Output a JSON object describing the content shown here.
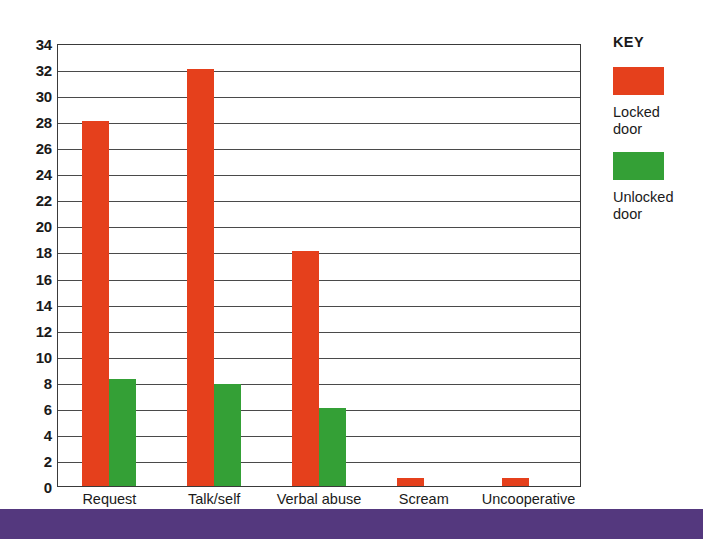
{
  "chart_data": {
    "type": "bar",
    "title": "",
    "subtitle": "",
    "xlabel": "",
    "ylabel": "",
    "categories": [
      "Request",
      "Talk/self",
      "Verbal abuse",
      "Scream",
      "Uncooperative"
    ],
    "series": [
      {
        "name": "Locked door",
        "color": "#e5401c",
        "values": [
          28,
          32,
          18,
          0.6,
          0.6
        ]
      },
      {
        "name": "Unlocked door",
        "color": "#34a036",
        "values": [
          8.2,
          7.8,
          6,
          0,
          0
        ]
      }
    ],
    "ylim": [
      0,
      34
    ],
    "ytick_step": 2,
    "yticks": [
      "34",
      "32",
      "30",
      "28",
      "26",
      "24",
      "22",
      "20",
      "18",
      "16",
      "14",
      "12",
      "10",
      "8",
      "6",
      "4",
      "2",
      "0"
    ],
    "grid": true,
    "grid_axis": "y",
    "legend_position": "right"
  },
  "legend": {
    "title": "KEY",
    "entries": [
      {
        "swatch": "locked-door-swatch",
        "label": "Locked\ndoor"
      },
      {
        "swatch": "unlocked-door-swatch",
        "label": "Unlocked\ndoor"
      }
    ]
  },
  "footer": {
    "band_text": ""
  },
  "colors": {
    "locked": "#e5401c",
    "unlocked": "#34a036",
    "axis": "#3a3a3a",
    "grid": "#4a4a4a",
    "band": "#54387e",
    "background": "#ffffff"
  }
}
